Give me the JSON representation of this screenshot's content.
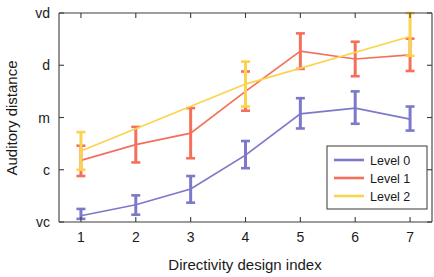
{
  "chart_data": {
    "type": "line",
    "title": "",
    "xlabel": "Directivity design index",
    "ylabel": "Auditory distance",
    "x": [
      1,
      2,
      3,
      4,
      5,
      6,
      7
    ],
    "xtick_labels": [
      "1",
      "2",
      "3",
      "4",
      "5",
      "6",
      "7"
    ],
    "ytick_labels": [
      "vc",
      "c",
      "m",
      "d",
      "vd"
    ],
    "ytick_values": [
      0,
      1,
      2,
      3,
      4
    ],
    "ylim": [
      0,
      4
    ],
    "xlim": [
      0.6,
      7.4
    ],
    "grid": false,
    "legend_position": "lower-right",
    "error_bars": true,
    "series": [
      {
        "name": "Level 0",
        "color": "#7b79c8",
        "x": [
          1,
          2,
          3,
          4,
          5,
          6,
          7
        ],
        "values": [
          0.12,
          0.33,
          0.63,
          1.28,
          2.07,
          2.18,
          1.97
        ],
        "err_low": [
          0.06,
          0.19,
          0.26,
          0.25,
          0.28,
          0.3,
          0.22
        ],
        "err_high": [
          0.13,
          0.18,
          0.25,
          0.27,
          0.3,
          0.32,
          0.24
        ]
      },
      {
        "name": "Level 1",
        "color": "#f5705a",
        "x": [
          1,
          2,
          3,
          4,
          5,
          6,
          7
        ],
        "values": [
          1.18,
          1.48,
          1.7,
          2.5,
          3.27,
          3.12,
          3.2
        ],
        "err_low": [
          0.3,
          0.34,
          0.48,
          0.37,
          0.34,
          0.33,
          0.31
        ],
        "err_high": [
          0.28,
          0.34,
          0.48,
          0.38,
          0.34,
          0.33,
          0.31
        ]
      },
      {
        "name": "Level 2",
        "color": "#fbd34d",
        "x": [
          1,
          4,
          7
        ],
        "values": [
          1.36,
          2.64,
          3.55
        ],
        "err_low": [
          0.36,
          0.43,
          0.37
        ],
        "err_high": [
          0.36,
          0.43,
          0.45
        ]
      }
    ]
  },
  "legend": {
    "entries": [
      {
        "label": "Level 0",
        "color": "#7b79c8"
      },
      {
        "label": "Level 1",
        "color": "#f5705a"
      },
      {
        "label": "Level 2",
        "color": "#fbd34d"
      }
    ]
  },
  "axes": {
    "x_title": "Directivity design index",
    "y_title": "Auditory distance"
  }
}
